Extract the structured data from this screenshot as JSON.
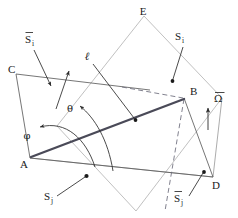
{
  "figure": {
    "background_color": "#ffffff",
    "stroke_dark": "#3a3a3a",
    "stroke_light": "#b9b9b9",
    "stroke_thick": "#4a4a58",
    "label_color": "#1a1a1a"
  },
  "vertices": {
    "A": {
      "label": "A",
      "x": 30,
      "y": 158
    },
    "B": {
      "label": "B",
      "x": 184,
      "y": 98
    },
    "C": {
      "label": "C",
      "x": 16,
      "y": 74
    },
    "D": {
      "label": "D",
      "x": 213,
      "y": 177
    },
    "E": {
      "label": "E",
      "x": 144,
      "y": 16
    }
  },
  "angles": {
    "theta": {
      "label": "θ",
      "x": 70,
      "y": 112
    },
    "phi": {
      "label": "φ",
      "x": 27,
      "y": 139
    }
  },
  "vectors": {
    "s_i_bar": {
      "base": "S",
      "accent": "bar",
      "sub": "i",
      "label": "S",
      "sub_label": "i",
      "x": 27,
      "y": 40
    },
    "s_i": {
      "base": "S",
      "accent": "none",
      "sub": "i",
      "label": "S",
      "sub_label": "i",
      "x": 176,
      "y": 37
    },
    "s_j": {
      "base": "S",
      "accent": "none",
      "sub": "j",
      "label": "S",
      "sub_label": "j",
      "x": 45,
      "y": 199
    },
    "s_j_bar": {
      "base": "S",
      "accent": "bar",
      "sub": "j",
      "label": "S",
      "sub_label": "j",
      "x": 176,
      "y": 199
    },
    "omega_bar": {
      "base": "Ω",
      "accent": "bar",
      "label": "Ω",
      "x": 217,
      "y": 100
    }
  },
  "lines": {
    "ell": {
      "label": "ℓ",
      "x": 87,
      "y": 60
    }
  },
  "legend_note": ""
}
